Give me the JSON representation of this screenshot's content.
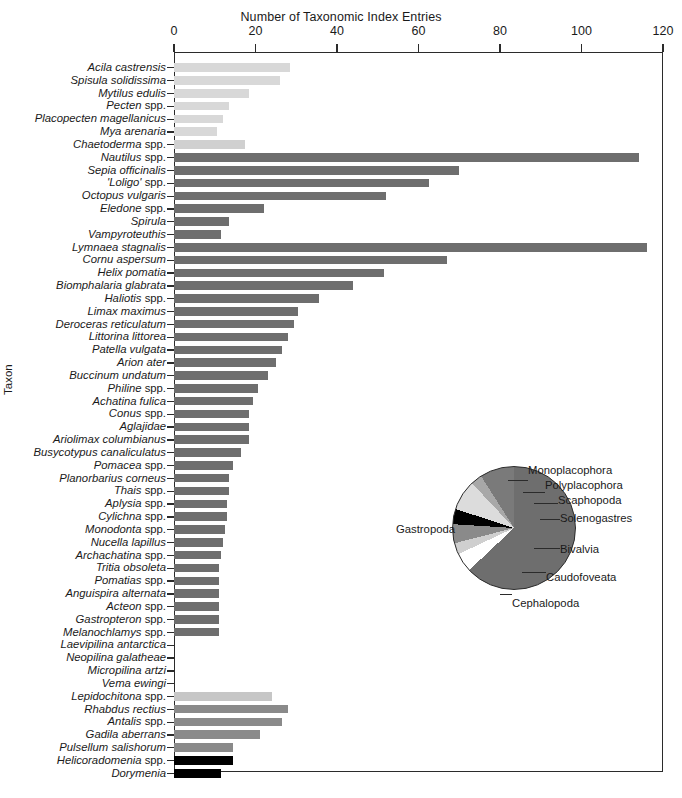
{
  "chart_data": {
    "type": "bar",
    "title": "",
    "xlabel": "Number of Taxonomic Index Entries",
    "ylabel": "Taxon",
    "orientation": "horizontal",
    "xlim": [
      0,
      120
    ],
    "xticks": [
      0,
      20,
      40,
      60,
      80,
      100,
      120
    ],
    "grid": false,
    "legend": "none",
    "categories": [
      "Acila castrensis",
      "Spisula solidissima",
      "Mytilus edulis",
      "Pecten spp.",
      "Placopecten magellanicus",
      "Mya arenaria",
      "Chaetoderma spp.",
      "Nautilus spp.",
      "Sepia officinalis",
      "'Loligo' spp.",
      "Octopus vulgaris",
      "Eledone spp.",
      "Spirula",
      "Vampyroteuthis",
      "Lymnaea stagnalis",
      "Cornu aspersum",
      "Helix pomatia",
      "Biomphalaria glabrata",
      "Haliotis spp.",
      "Limax maximus",
      "Deroceras reticulatum",
      "Littorina littorea",
      "Patella vulgata",
      "Arion ater",
      "Buccinum undatum",
      "Philine spp.",
      "Achatina fulica",
      "Conus spp.",
      "Aglajidae",
      "Ariolimax columbianus",
      "Busycotypus canaliculatus",
      "Pomacea spp.",
      "Planorbarius corneus",
      "Thais spp.",
      "Aplysia spp.",
      "Cylichna spp.",
      "Monodonta spp.",
      "Nucella lapillus",
      "Archachatina spp.",
      "Tritia obsoleta",
      "Pomatias spp.",
      "Anguispira alternata",
      "Acteon spp.",
      "Gastropteron spp.",
      "Melanochlamys spp.",
      "Laevipilina antarctica",
      "Neopilina galatheae",
      "Micropilina artzi",
      "Vema ewingi",
      "Lepidochitona spp.",
      "Rhabdus rectius",
      "Antalis spp.",
      "Gadila aberrans",
      "Pulsellum salishorum",
      "Helicoradomenia spp.",
      "Dorymenia"
    ],
    "values": [
      28.5,
      26,
      18.5,
      13.5,
      12,
      10.5,
      17.5,
      114,
      70,
      62.5,
      52,
      22,
      13.5,
      11.5,
      116,
      67,
      51.5,
      44,
      35.5,
      30.5,
      29.5,
      28,
      26.5,
      25,
      23,
      20.5,
      19.5,
      18.5,
      18.5,
      18.5,
      16.5,
      14.5,
      13.5,
      13.5,
      13,
      13,
      12.5,
      12,
      11.5,
      11,
      11,
      11,
      11,
      11,
      11,
      0,
      0,
      0,
      0,
      24,
      28,
      26.5,
      21,
      14.5,
      14.5,
      11.5
    ],
    "bar_classes": [
      "Bivalvia",
      "Bivalvia",
      "Bivalvia",
      "Bivalvia",
      "Bivalvia",
      "Bivalvia",
      "Caudofoveata",
      "Cephalopoda",
      "Cephalopoda",
      "Cephalopoda",
      "Cephalopoda",
      "Cephalopoda",
      "Cephalopoda",
      "Cephalopoda",
      "Gastropoda",
      "Gastropoda",
      "Gastropoda",
      "Gastropoda",
      "Gastropoda",
      "Gastropoda",
      "Gastropoda",
      "Gastropoda",
      "Gastropoda",
      "Gastropoda",
      "Gastropoda",
      "Gastropoda",
      "Gastropoda",
      "Gastropoda",
      "Gastropoda",
      "Gastropoda",
      "Gastropoda",
      "Gastropoda",
      "Gastropoda",
      "Gastropoda",
      "Gastropoda",
      "Gastropoda",
      "Gastropoda",
      "Gastropoda",
      "Gastropoda",
      "Gastropoda",
      "Gastropoda",
      "Gastropoda",
      "Gastropoda",
      "Gastropoda",
      "Gastropoda",
      "Monoplacophora",
      "Monoplacophora",
      "Monoplacophora",
      "Monoplacophora",
      "Polyplacophora",
      "Scaphopoda",
      "Scaphopoda",
      "Scaphopoda",
      "Scaphopoda",
      "Solenogastres",
      "Solenogastres"
    ],
    "class_colors": {
      "Bivalvia": "#d8d8d8",
      "Caudofoveata": "#d0d0d0",
      "Cephalopoda": "#6e6e6e",
      "Gastropoda": "#6e6e6e",
      "Monoplacophora": "#ffffff",
      "Polyplacophora": "#c6c6c6",
      "Scaphopoda": "#8a8a8a",
      "Solenogastres": "#000000"
    },
    "pie": {
      "type": "pie",
      "slices": [
        {
          "label": "Gastropoda",
          "percent": 63.0,
          "color": "#6e6e6e"
        },
        {
          "label": "Monoplacophora",
          "percent": 5.0,
          "color": "#ffffff"
        },
        {
          "label": "Polyplacophora",
          "percent": 3.0,
          "color": "#cfcfcf"
        },
        {
          "label": "Scaphopoda",
          "percent": 5.0,
          "color": "#8a8a8a"
        },
        {
          "label": "Solenogastres",
          "percent": 4.0,
          "color": "#000000"
        },
        {
          "label": "Bivalvia",
          "percent": 8.0,
          "color": "#dcdcdc"
        },
        {
          "label": "Caudofoveata",
          "percent": 3.0,
          "color": "#a8a8a8"
        },
        {
          "label": "Cephalopoda",
          "percent": 9.0,
          "color": "#7a7a7a"
        }
      ],
      "labels_position": "outside-right"
    }
  },
  "axis": {
    "x_title": "Number of Taxonomic Index Entries",
    "y_title": "Taxon",
    "tick_labels": [
      "0",
      "20",
      "40",
      "60",
      "80",
      "100",
      "120"
    ]
  },
  "pie_labels": {
    "monoplacophora": "Monoplacophora",
    "polyplacophora": "Polyplacophora",
    "scaphopoda": "Scaphopoda",
    "solenogastres": "Solenogastres",
    "bivalvia": "Bivalvia",
    "caudofoveata": "Caudofoveata",
    "cephalopoda": "Cephalopoda",
    "gastropoda": "Gastropoda"
  }
}
